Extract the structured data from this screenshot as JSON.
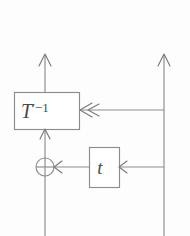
{
  "figure": {
    "type": "block-diagram",
    "title": "",
    "background_color": "#fdfdfd",
    "line_color": "#8d8d8d",
    "text_color": "#4a4a4a",
    "width": 190,
    "height": 236
  },
  "blocks": [
    {
      "id": "t-inverse",
      "label": "T",
      "prime": "′",
      "exponent": "−1",
      "full_label": "T′⁻¹",
      "x": 14,
      "y": 92,
      "width": 65,
      "height": 37
    },
    {
      "id": "tweak",
      "label": "t",
      "full_label": "t",
      "x": 89,
      "y": 147,
      "width": 30,
      "height": 40
    }
  ],
  "operators": [
    {
      "id": "xor",
      "name": "xor-gate",
      "symbol": "⊕",
      "cx": 45,
      "cy": 167,
      "r": 9
    }
  ],
  "wires": [
    {
      "id": "left-vertical",
      "name": "left-data-line",
      "from": "bottom",
      "to": "top",
      "x": 45
    },
    {
      "id": "right-vertical",
      "name": "right-data-line",
      "from": "bottom",
      "to": "top",
      "x": 164
    },
    {
      "id": "right-to-tinv",
      "name": "branch-to-t-inverse",
      "y": 110
    },
    {
      "id": "right-to-tweak",
      "name": "branch-to-tweak",
      "y": 167
    },
    {
      "id": "tweak-to-xor",
      "name": "tweak-output-to-xor",
      "y": 167
    },
    {
      "id": "xor-to-tinv",
      "name": "xor-output-to-t-inverse",
      "x": 45
    }
  ],
  "arrowheads": [
    {
      "id": "top-left-arrow",
      "name": "left-output-arrow",
      "direction": "up",
      "x": 45,
      "y": 54
    },
    {
      "id": "top-right-arrow",
      "name": "right-output-arrow",
      "direction": "up",
      "x": 164,
      "y": 54
    },
    {
      "id": "tinv-bottom-arrow",
      "name": "t-inverse-input-arrow",
      "direction": "up",
      "x": 45,
      "y": 129
    },
    {
      "id": "tinv-right-arrow",
      "name": "t-inverse-key-arrow",
      "direction": "left",
      "x": 79,
      "y": 110,
      "style": "double"
    },
    {
      "id": "tweak-right-arrow",
      "name": "tweak-input-arrow",
      "direction": "left",
      "x": 119,
      "y": 167
    },
    {
      "id": "xor-right-arrow",
      "name": "xor-input-arrow",
      "direction": "left",
      "x": 54,
      "y": 167
    }
  ]
}
